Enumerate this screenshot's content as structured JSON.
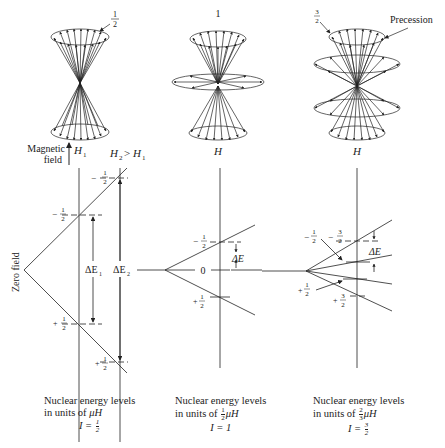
{
  "figure": {
    "panels": [
      {
        "id": "spin-half",
        "cone_label": "1/2",
        "field_symbol": "H1",
        "field_label": "Magnetic field",
        "field_comparison": "H2 > H1",
        "zero_field_label": "Zero field",
        "levels_upper": [
          "-1/2",
          "-1/2"
        ],
        "levels_lower": [
          "+1/2",
          "+1/2"
        ],
        "gaps": [
          "ΔE1",
          "ΔE2"
        ],
        "caption_line1": "Nuclear energy levels",
        "caption_line2_prefix": "in units of ",
        "caption_unit": "μH",
        "caption_unit_frac": "",
        "caption_spin": "I = 1/2",
        "spin_num": "1",
        "spin_den": "2"
      },
      {
        "id": "spin-one",
        "cone_label": "1",
        "field_symbol": "H",
        "levels": [
          "-1/2",
          "0",
          "+1/2"
        ],
        "gap": "ΔE",
        "caption_line1": "Nuclear energy levels",
        "caption_line2_prefix": "in units of ",
        "caption_unit": "μH",
        "caption_unit_frac_num": "1",
        "caption_unit_frac_den": "2",
        "caption_spin": "I = 1"
      },
      {
        "id": "spin-three-halves",
        "cone_label": "3/2",
        "precession_label": "Precession",
        "field_symbol": "H",
        "levels": [
          "-3/2",
          "-1/2",
          "+1/2",
          "+3/2"
        ],
        "gap": "ΔE",
        "caption_line1": "Nuclear energy levels",
        "caption_line2_prefix": "in units of ",
        "caption_unit": "μH",
        "caption_unit_frac_num": "2",
        "caption_unit_frac_den": "3",
        "caption_spin_prefix": "I = ",
        "spin_num": "3",
        "spin_den": "2"
      }
    ],
    "text": {
      "one_half_num": "1",
      "one_half_den": "2",
      "three_half_num": "3",
      "three_half_den": "2",
      "one": "1",
      "minus": "−",
      "plus": "+",
      "zero": "0",
      "H": "H",
      "H1": "H",
      "sub1": "1",
      "sub2": "2",
      "H2gtH1": ">",
      "magnetic": "Magnetic",
      "field": "field",
      "zero_field": "Zero field",
      "dE": "ΔE",
      "dE1": "ΔE",
      "dE2": "ΔE",
      "precession": "Precession"
    }
  }
}
